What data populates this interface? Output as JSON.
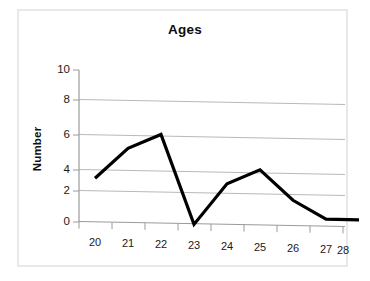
{
  "chart_data": {
    "type": "line",
    "title": "Ages",
    "xlabel": "",
    "ylabel": "Number",
    "categories": [
      "20",
      "21",
      "22",
      "23",
      "24",
      "25",
      "26",
      "27",
      "28"
    ],
    "x": [
      20,
      21,
      22,
      23,
      24,
      25,
      26,
      27,
      28
    ],
    "values": [
      2.9,
      4.9,
      5.85,
      0.0,
      2.7,
      3.65,
      1.7,
      0.5,
      0.5
    ],
    "series": [
      {
        "name": "Number",
        "values": [
          2.9,
          4.9,
          5.85,
          0.0,
          2.7,
          3.65,
          1.7,
          0.5,
          0.5
        ]
      }
    ],
    "ylim": [
      0,
      10
    ],
    "yticks": [
      "0",
      "2",
      "4",
      "6",
      "8",
      "10"
    ],
    "ytick_values": [
      0,
      2,
      4,
      6,
      8,
      10
    ],
    "grid": "horizontal",
    "legend": "none",
    "line_color": "#000000",
    "gridline_color": "#b9b9b9",
    "axis_color": "#9a9a9a",
    "border_color": "#e8e8e8",
    "background": "#ffffff"
  },
  "chart": {
    "title": "Ages",
    "y_axis_title": "Number"
  }
}
